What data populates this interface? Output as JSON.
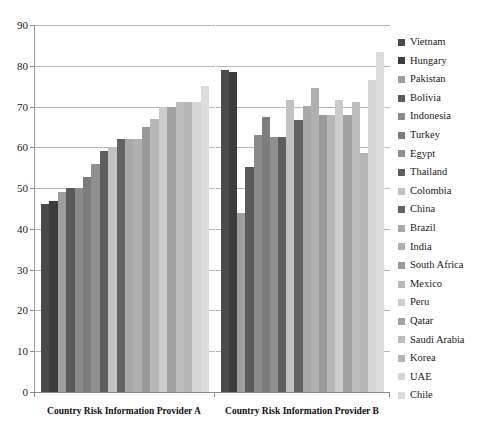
{
  "chart_data": {
    "type": "bar",
    "title": "",
    "subtitle": "",
    "xlabel": "",
    "ylabel": "",
    "ylim": [
      0,
      90
    ],
    "yticks": [
      0,
      10,
      20,
      30,
      40,
      50,
      60,
      70,
      80,
      90
    ],
    "ytick_labels": [
      "0",
      "10",
      "20",
      "30",
      "40",
      "50",
      "60",
      "70",
      "80",
      "90"
    ],
    "grid": true,
    "legend_position": "right",
    "categories": [
      "Country Risk Information Provider A",
      "Country Risk Information Provider B"
    ],
    "series": [
      {
        "name": "Vietnam",
        "color": "#4a4a4a",
        "values": [
          46.0,
          79.0
        ]
      },
      {
        "name": "Hungary",
        "color": "#3c3c3c",
        "values": [
          46.8,
          78.5
        ]
      },
      {
        "name": "Pakistan",
        "color": "#9e9e9e",
        "values": [
          49.0,
          43.8
        ]
      },
      {
        "name": "Bolivia",
        "color": "#5a5a5a",
        "values": [
          50.0,
          55.2
        ]
      },
      {
        "name": "Indonesia",
        "color": "#8a8a8a",
        "values": [
          50.0,
          63.0
        ]
      },
      {
        "name": "Turkey",
        "color": "#7c7c7c",
        "values": [
          52.8,
          67.5
        ]
      },
      {
        "name": "Egypt",
        "color": "#8f8f8f",
        "values": [
          56.0,
          62.5
        ]
      },
      {
        "name": "Thailand",
        "color": "#5e5e5e",
        "values": [
          59.0,
          62.5
        ]
      },
      {
        "name": "Colombia",
        "color": "#c2c2c2",
        "values": [
          60.0,
          71.5
        ]
      },
      {
        "name": "China",
        "color": "#636363",
        "values": [
          62.0,
          66.8
        ]
      },
      {
        "name": "Brazil",
        "color": "#a8a8a8",
        "values": [
          62.0,
          70.2
        ]
      },
      {
        "name": "India",
        "color": "#b0b0b0",
        "values": [
          62.0,
          74.5
        ]
      },
      {
        "name": "South Africa",
        "color": "#9a9a9a",
        "values": [
          65.0,
          68.0
        ]
      },
      {
        "name": "Mexico",
        "color": "#b8b8b8",
        "values": [
          67.0,
          68.0
        ]
      },
      {
        "name": "Peru",
        "color": "#cccccc",
        "values": [
          70.0,
          71.5
        ]
      },
      {
        "name": "Qatar",
        "color": "#a2a2a2",
        "values": [
          69.8,
          68.0
        ]
      },
      {
        "name": "Saudi Arabia",
        "color": "#bdbdbd",
        "values": [
          71.0,
          71.0
        ]
      },
      {
        "name": "Korea",
        "color": "#b5b5b5",
        "values": [
          71.0,
          58.5
        ]
      },
      {
        "name": "UAE",
        "color": "#d6d6d6",
        "values": [
          71.0,
          76.5
        ]
      },
      {
        "name": "Chile",
        "color": "#dcdcdc",
        "values": [
          75.0,
          83.5
        ]
      }
    ]
  },
  "axis": {
    "y_ticks": [
      "90",
      "80",
      "70",
      "60",
      "50",
      "40",
      "30",
      "20",
      "10",
      "0"
    ],
    "x_categories": [
      "Country Risk Information Provider A",
      "Country Risk Information Provider B"
    ]
  },
  "legend": {
    "items": [
      "Vietnam",
      "Hungary",
      "Pakistan",
      "Bolivia",
      "Indonesia",
      "Turkey",
      "Egypt",
      "Thailand",
      "Colombia",
      "China",
      "Brazil",
      "India",
      "South Africa",
      "Mexico",
      "Peru",
      "Qatar",
      "Saudi Arabia",
      "Korea",
      "UAE",
      "Chile"
    ]
  },
  "colors": {
    "gridline": "#b7b7b7",
    "axis": "#8d8d8d",
    "text": "#1a1a1a",
    "background": "#ffffff"
  }
}
